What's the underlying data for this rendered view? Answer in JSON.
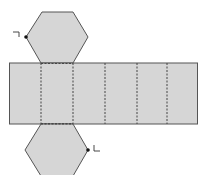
{
  "diagram": {
    "type": "net-of-hexagonal-prism",
    "fill_color": "#d6d6d6",
    "stroke_color": "#555555",
    "dash_color": "#444444",
    "top_hexagon": {
      "label": "top-face"
    },
    "bottom_hexagon": {
      "label": "bottom-face"
    },
    "lateral_faces": 6,
    "right_angle_marks": [
      {
        "position": "top-hexagon-left-vertex",
        "symbol": "¬"
      },
      {
        "position": "bottom-hexagon-right-vertex",
        "symbol": "L"
      }
    ]
  }
}
